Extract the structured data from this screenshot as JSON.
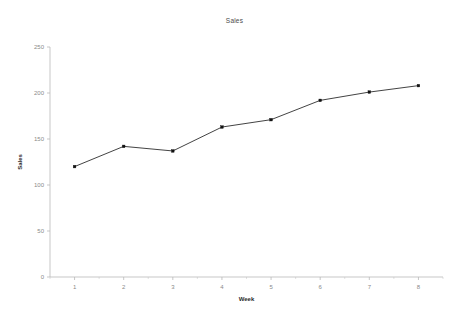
{
  "chart_data": {
    "type": "line",
    "title": "Sales",
    "xlabel": "Week",
    "ylabel": "Sales",
    "categories": [
      "1",
      "2",
      "3",
      "4",
      "5",
      "6",
      "7",
      "8"
    ],
    "x": [
      1,
      2,
      3,
      4,
      5,
      6,
      7,
      8
    ],
    "values": [
      120,
      142,
      137,
      163,
      171,
      192,
      201,
      208
    ],
    "series": [
      {
        "name": "Sales",
        "values": [
          120,
          142,
          137,
          163,
          171,
          192,
          201,
          208
        ]
      }
    ],
    "xlim": [
      0.5,
      8.5
    ],
    "ylim": [
      0,
      250
    ],
    "ytick_labels": [
      "0",
      "50",
      "100",
      "150",
      "200",
      "250"
    ],
    "ytick_values": [
      0,
      50,
      100,
      150,
      200,
      250
    ],
    "xtick_labels": [
      "1",
      "2",
      "3",
      "4",
      "5",
      "6",
      "7",
      "8"
    ],
    "grid": false,
    "legend": false,
    "legend_position": "none",
    "marker": "square",
    "line_color": "#2e2e2e",
    "marker_color": "#111111",
    "axis_color": "#b9b9b9",
    "background_color": "#ffffff"
  }
}
